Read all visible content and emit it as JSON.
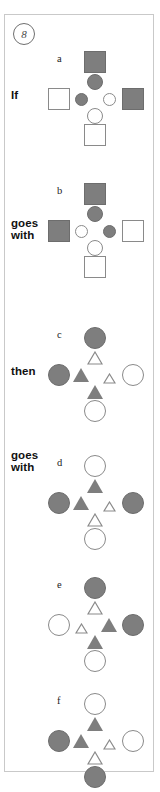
{
  "item": {
    "number": "8"
  },
  "leads": {
    "if": "If",
    "goes_with_1": "goes\nwith",
    "then": "then",
    "goes_with_2": "goes\nwith"
  },
  "panels": [
    {
      "letter": "a",
      "lead": "If",
      "top": {
        "shape": "square",
        "fill": "gray",
        "size": "large"
      },
      "upper": {
        "shape": "circle",
        "fill": "gray",
        "size": "medium"
      },
      "left": {
        "shape": "square",
        "fill": "white",
        "size": "large"
      },
      "inner_left": {
        "shape": "circle",
        "fill": "gray",
        "size": "small"
      },
      "inner_right": {
        "shape": "circle",
        "fill": "white",
        "size": "small"
      },
      "right": {
        "shape": "square",
        "fill": "gray",
        "size": "large"
      },
      "lower": {
        "shape": "circle",
        "fill": "white",
        "size": "medium"
      },
      "bottom": {
        "shape": "square",
        "fill": "white",
        "size": "large"
      }
    },
    {
      "letter": "b",
      "lead": "goes with",
      "top": {
        "shape": "square",
        "fill": "gray",
        "size": "large"
      },
      "upper": {
        "shape": "circle",
        "fill": "gray",
        "size": "medium"
      },
      "left": {
        "shape": "square",
        "fill": "gray",
        "size": "large"
      },
      "inner_left": {
        "shape": "circle",
        "fill": "white",
        "size": "small"
      },
      "inner_right": {
        "shape": "circle",
        "fill": "gray",
        "size": "small"
      },
      "right": {
        "shape": "square",
        "fill": "white",
        "size": "large"
      },
      "lower": {
        "shape": "circle",
        "fill": "white",
        "size": "medium"
      },
      "bottom": {
        "shape": "square",
        "fill": "white",
        "size": "large"
      }
    },
    {
      "letter": "c",
      "lead": "then",
      "top": {
        "shape": "circle",
        "fill": "gray",
        "size": "large"
      },
      "upper": {
        "shape": "triangle",
        "fill": "white",
        "size": "medium"
      },
      "left": {
        "shape": "circle",
        "fill": "gray",
        "size": "large"
      },
      "inner_left": {
        "shape": "triangle",
        "fill": "gray",
        "size": "medium"
      },
      "inner_right": {
        "shape": "triangle",
        "fill": "white",
        "size": "small"
      },
      "right": {
        "shape": "circle",
        "fill": "white",
        "size": "large"
      },
      "lower": {
        "shape": "triangle",
        "fill": "gray",
        "size": "medium"
      },
      "bottom": {
        "shape": "circle",
        "fill": "white",
        "size": "large"
      }
    },
    {
      "letter": "d",
      "lead": "goes with",
      "top": {
        "shape": "circle",
        "fill": "white",
        "size": "large"
      },
      "upper": {
        "shape": "triangle",
        "fill": "gray",
        "size": "medium"
      },
      "left": {
        "shape": "circle",
        "fill": "gray",
        "size": "large"
      },
      "inner_left": {
        "shape": "triangle",
        "fill": "gray",
        "size": "medium"
      },
      "inner_right": {
        "shape": "triangle",
        "fill": "white",
        "size": "small"
      },
      "right": {
        "shape": "circle",
        "fill": "gray",
        "size": "large"
      },
      "lower": {
        "shape": "triangle",
        "fill": "white",
        "size": "medium"
      },
      "bottom": {
        "shape": "circle",
        "fill": "white",
        "size": "large"
      }
    },
    {
      "letter": "e",
      "lead": "",
      "top": {
        "shape": "circle",
        "fill": "gray",
        "size": "large"
      },
      "upper": {
        "shape": "triangle",
        "fill": "white",
        "size": "medium"
      },
      "left": {
        "shape": "circle",
        "fill": "white",
        "size": "large"
      },
      "inner_left": {
        "shape": "triangle",
        "fill": "white",
        "size": "small"
      },
      "inner_right": {
        "shape": "triangle",
        "fill": "gray",
        "size": "medium"
      },
      "right": {
        "shape": "circle",
        "fill": "gray",
        "size": "large"
      },
      "lower": {
        "shape": "triangle",
        "fill": "gray",
        "size": "medium"
      },
      "bottom": {
        "shape": "circle",
        "fill": "white",
        "size": "large"
      }
    },
    {
      "letter": "f",
      "lead": "",
      "top": {
        "shape": "circle",
        "fill": "white",
        "size": "large"
      },
      "upper": {
        "shape": "triangle",
        "fill": "gray",
        "size": "medium"
      },
      "left": {
        "shape": "circle",
        "fill": "gray",
        "size": "large"
      },
      "inner_left": {
        "shape": "triangle",
        "fill": "gray",
        "size": "medium"
      },
      "inner_right": {
        "shape": "triangle",
        "fill": "white",
        "size": "small"
      },
      "right": {
        "shape": "circle",
        "fill": "white",
        "size": "large"
      },
      "lower": {
        "shape": "triangle",
        "fill": "white",
        "size": "medium"
      },
      "bottom": {
        "shape": "circle",
        "fill": "gray",
        "size": "large"
      }
    }
  ],
  "colors": {
    "fill_gray": "#7e7e7e",
    "outline_gray": "#8a8a8a",
    "background": "#ffffff",
    "border": "#c9c9c9"
  }
}
